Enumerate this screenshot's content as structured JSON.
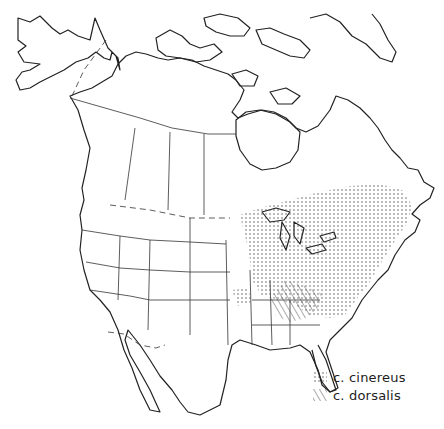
{
  "map": {
    "region": "North America",
    "style": "black-and-white outline map",
    "colors": {
      "outline": "#222222",
      "river": "#555555",
      "background": "#ffffff"
    }
  },
  "legend": {
    "items": [
      {
        "label": "c. cinereus",
        "pattern": "dots"
      },
      {
        "label": "c. dorsalis",
        "pattern": "hatch"
      }
    ]
  }
}
